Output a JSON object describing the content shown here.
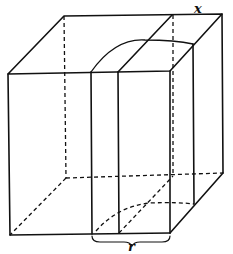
{
  "figure": {
    "labels": {
      "x": "x",
      "r": "r"
    },
    "colors": {
      "stroke": "#111111",
      "background": "#ffffff"
    }
  }
}
